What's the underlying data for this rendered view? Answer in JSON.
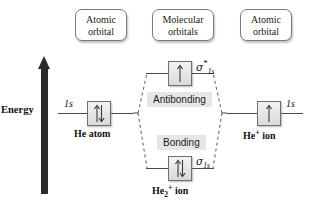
{
  "diagram": {
    "axis_label": "Energy",
    "colors": {
      "arrow": "#2b2b2b",
      "box_border": "#6f6f6f",
      "level_line": "#4a4a4a",
      "region_shade": "#e6e6e6",
      "background": "#ffffff"
    }
  },
  "captions": {
    "left": {
      "line1": "Atomic",
      "line2": "orbital"
    },
    "middle": {
      "line1": "Molecular",
      "line2": "orbitals"
    },
    "right": {
      "line1": "Atomic",
      "line2": "orbital"
    }
  },
  "levels": {
    "he_atom": {
      "orbital_label": "1s",
      "species_label": "He atom",
      "electrons": 2,
      "spin": "up-down"
    },
    "antibonding": {
      "mo_label_greek": "σ",
      "mo_label_star": "*",
      "mo_label_sub": "1s",
      "region_label": "Antibonding",
      "electrons": 1,
      "spin": "up"
    },
    "bonding": {
      "mo_label_greek": "σ",
      "mo_label_sub": "1s",
      "region_label": "Bonding",
      "electrons": 2,
      "spin": "up-down",
      "species_label_base": "He",
      "species_label_sub": "2",
      "species_label_sup": "+",
      "species_label_tail": " ion"
    },
    "he_plus_ion": {
      "orbital_label": "1s",
      "species_label_base": "He",
      "species_label_sup": "+",
      "species_label_tail": " ion",
      "electrons": 1,
      "spin": "up"
    }
  }
}
